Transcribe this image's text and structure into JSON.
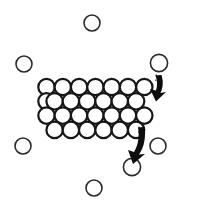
{
  "figure": {
    "background_color": "#ffffff",
    "width": 206,
    "height": 211
  },
  "style": {
    "free_circle_stroke": "#2b2b2b",
    "free_circle_fill": "#ffffff",
    "free_circle_stroke_width": 1.6,
    "cluster_circle_stroke": "#171717",
    "cluster_circle_fill": "#ffffff",
    "cluster_circle_stroke_width": 2.2,
    "arrow_color": "#0d0d0d"
  },
  "cluster": {
    "label": "hexagonal close-packed circle cluster",
    "rows": 4,
    "radius": 8.2,
    "row_counts": [
      7,
      7,
      7,
      7
    ],
    "circles": [
      {
        "cx": 46.5,
        "cy": 87.0
      },
      {
        "cx": 62.8,
        "cy": 87.0
      },
      {
        "cx": 79.1,
        "cy": 87.0
      },
      {
        "cx": 95.4,
        "cy": 87.0
      },
      {
        "cx": 111.7,
        "cy": 87.0
      },
      {
        "cx": 128.0,
        "cy": 87.0
      },
      {
        "cx": 144.3,
        "cy": 87.0
      },
      {
        "cx": 54.6,
        "cy": 101.3
      },
      {
        "cx": 70.9,
        "cy": 101.3
      },
      {
        "cx": 87.2,
        "cy": 101.3
      },
      {
        "cx": 103.5,
        "cy": 101.3
      },
      {
        "cx": 119.8,
        "cy": 101.3
      },
      {
        "cx": 136.1,
        "cy": 101.3
      },
      {
        "cx": 46.5,
        "cy": 101.3
      },
      {
        "cx": 46.5,
        "cy": 115.6
      },
      {
        "cx": 62.8,
        "cy": 115.6
      },
      {
        "cx": 79.1,
        "cy": 115.6
      },
      {
        "cx": 95.4,
        "cy": 115.6
      },
      {
        "cx": 111.7,
        "cy": 115.6
      },
      {
        "cx": 128.0,
        "cy": 115.6
      },
      {
        "cx": 144.3,
        "cy": 115.6
      },
      {
        "cx": 54.6,
        "cy": 129.9
      },
      {
        "cx": 70.9,
        "cy": 129.9
      },
      {
        "cx": 87.2,
        "cy": 129.9
      },
      {
        "cx": 103.5,
        "cy": 129.9
      },
      {
        "cx": 119.8,
        "cy": 129.9
      },
      {
        "cx": 136.1,
        "cy": 129.9
      }
    ]
  },
  "free_particles": {
    "label": "isolated free circles",
    "radius": 8.0,
    "circles": [
      {
        "name": "free-circle-top",
        "cx": 92.0,
        "cy": 23.0
      },
      {
        "name": "free-circle-left-upper",
        "cx": 24.0,
        "cy": 64.0
      },
      {
        "name": "free-circle-right-upper",
        "cx": 159.0,
        "cy": 63.0
      },
      {
        "name": "free-circle-left-lower",
        "cx": 23.0,
        "cy": 146.0
      },
      {
        "name": "free-circle-right-lower",
        "cx": 158.0,
        "cy": 146.0
      },
      {
        "name": "free-circle-arrow-target",
        "cx": 132.0,
        "cy": 167.0
      },
      {
        "name": "free-circle-bottom",
        "cx": 94.0,
        "cy": 188.0
      }
    ]
  },
  "arrows": [
    {
      "name": "arrow-upper-right",
      "direction": "down-left",
      "tail_x": 160.0,
      "tail_y": 76.0,
      "tip_x": 152.0,
      "tip_y": 98.0,
      "color": "#0d0d0d"
    },
    {
      "name": "arrow-lower-center",
      "direction": "down-left",
      "tail_x": 143.0,
      "tail_y": 128.0,
      "tip_x": 132.0,
      "tip_y": 160.0,
      "color": "#0d0d0d"
    }
  ]
}
